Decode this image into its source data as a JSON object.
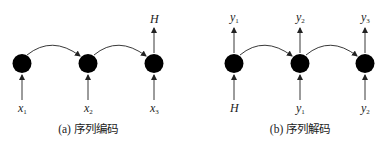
{
  "panels": [
    {
      "id": "encoding",
      "caption": "(a) 序列编码",
      "nodes": [
        {
          "input": {
            "base": "x",
            "sub": "1"
          },
          "output": null
        },
        {
          "input": {
            "base": "x",
            "sub": "2"
          },
          "output": null
        },
        {
          "input": {
            "base": "x",
            "sub": "3"
          },
          "output": {
            "base": "H",
            "sub": ""
          }
        }
      ]
    },
    {
      "id": "decoding",
      "caption": "(b) 序列解码",
      "nodes": [
        {
          "input": {
            "base": "H",
            "sub": ""
          },
          "output": {
            "base": "y",
            "sub": "1"
          }
        },
        {
          "input": {
            "base": "y",
            "sub": "1"
          },
          "output": {
            "base": "y",
            "sub": "2"
          }
        },
        {
          "input": {
            "base": "y",
            "sub": "2"
          },
          "output": {
            "base": "y",
            "sub": "3"
          }
        }
      ]
    }
  ],
  "colors": {
    "node": "#000000",
    "line": "#222222",
    "background": "#ffffff"
  }
}
